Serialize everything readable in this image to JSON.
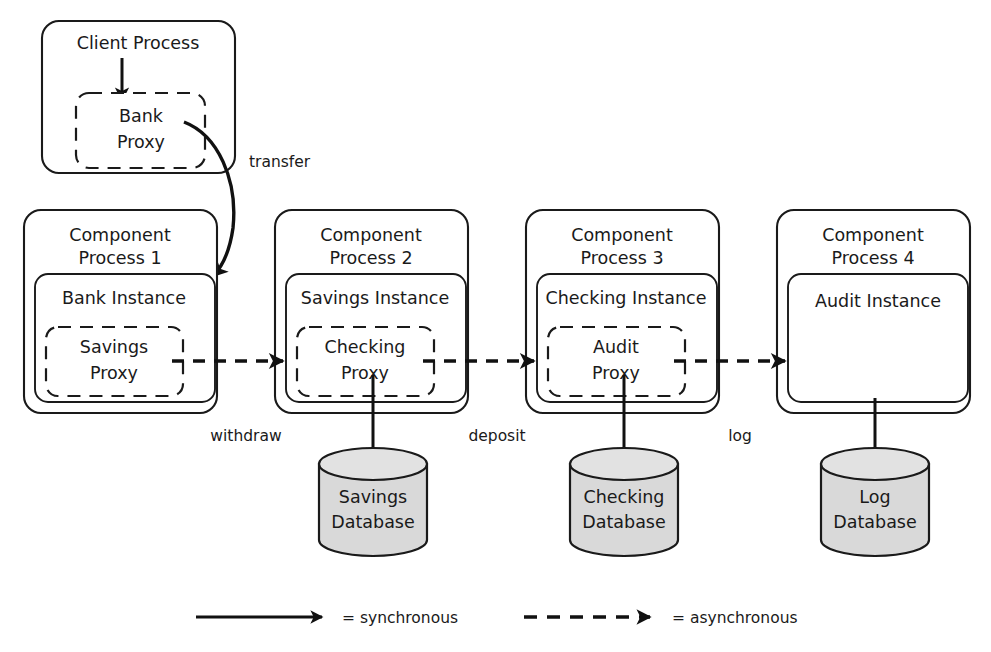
{
  "diagram": {
    "colors": {
      "stroke": "#1a1a1a",
      "database_fill": "#d9d9d9",
      "background": "#ffffff"
    },
    "client": {
      "box_label_line1": "Client Process",
      "proxy_label_line1": "Bank",
      "proxy_label_line2": "Proxy"
    },
    "processes": [
      {
        "box_label_line1": "Component",
        "box_label_line2": "Process 1",
        "instance_label": "Bank Instance",
        "proxy_label_line1": "Savings",
        "proxy_label_line2": "Proxy",
        "has_proxy": true,
        "database": null
      },
      {
        "box_label_line1": "Component",
        "box_label_line2": "Process 2",
        "instance_label": "Savings Instance",
        "proxy_label_line1": "Checking",
        "proxy_label_line2": "Proxy",
        "has_proxy": true,
        "database": {
          "line1": "Savings",
          "line2": "Database"
        }
      },
      {
        "box_label_line1": "Component",
        "box_label_line2": "Process 3",
        "instance_label": "Checking Instance",
        "proxy_label_line1": "Audit",
        "proxy_label_line2": "Proxy",
        "has_proxy": true,
        "database": {
          "line1": "Checking",
          "line2": "Database"
        }
      },
      {
        "box_label_line1": "Component",
        "box_label_line2": "Process 4",
        "instance_label": "Audit Instance",
        "proxy_label_line1": "",
        "proxy_label_line2": "",
        "has_proxy": false,
        "database": {
          "line1": "Log",
          "line2": "Database"
        }
      }
    ],
    "edges": {
      "transfer": "transfer",
      "withdraw": "withdraw",
      "deposit": "deposit",
      "log": "log"
    },
    "legend": {
      "synchronous": "= synchronous",
      "asynchronous": "= asynchronous"
    }
  }
}
